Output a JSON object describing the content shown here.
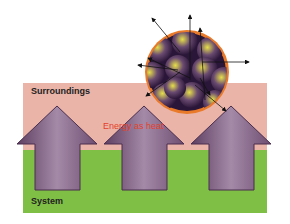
{
  "diagram": {
    "regions": [
      {
        "name": "surroundings",
        "label": "Surroundings",
        "color": "#eab4a8"
      },
      {
        "name": "system",
        "label": "System",
        "color": "#7fbf45"
      }
    ],
    "flow_label": "Energy as heat",
    "flow_label_color": "#e2412d",
    "arrows": {
      "count": 3,
      "direction": "up",
      "color": "#8c6a8c"
    },
    "particle_sphere": {
      "border_color": "#e87a2a",
      "particle_colors": [
        "#d8d040",
        "#3a2050"
      ]
    }
  }
}
